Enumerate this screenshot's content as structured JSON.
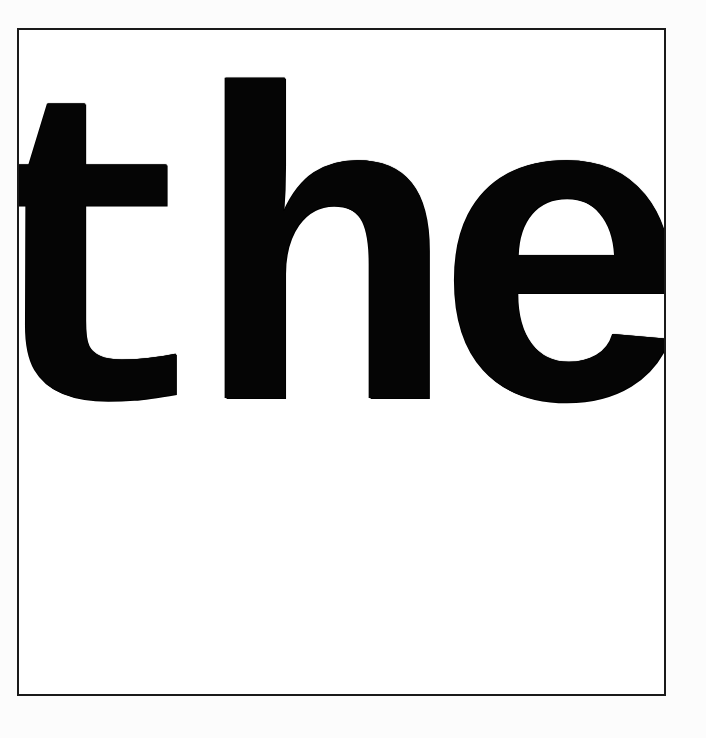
{
  "document": {
    "text": "the",
    "colors": {
      "ink": "#050505",
      "frame_border": "#1a1a1a",
      "paper": "#ffffff"
    }
  }
}
